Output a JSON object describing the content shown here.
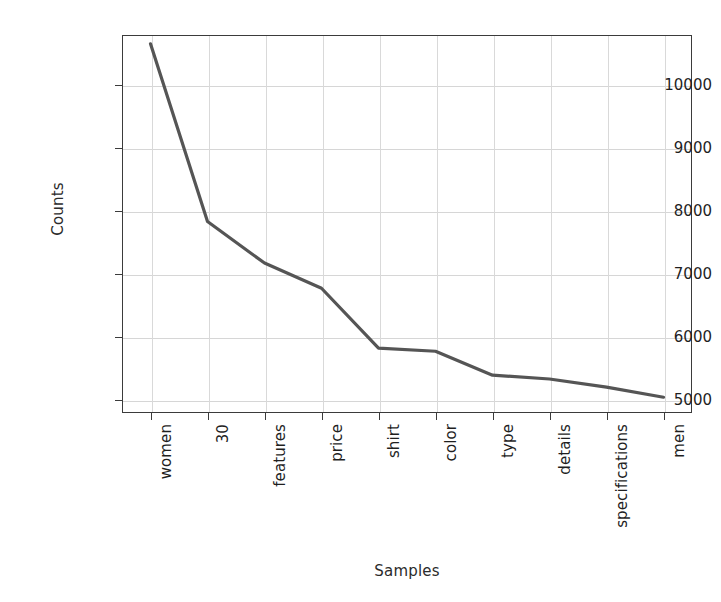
{
  "chart_data": {
    "type": "line",
    "title": "",
    "xlabel": "Samples",
    "ylabel": "Counts",
    "categories": [
      "women",
      "30",
      "features",
      "price",
      "shirt",
      "color",
      "type",
      "details",
      "specifications",
      "men"
    ],
    "values": [
      10660,
      7840,
      7180,
      6780,
      5830,
      5780,
      5400,
      5340,
      5210,
      5050
    ],
    "yticks": [
      5000,
      6000,
      7000,
      8000,
      9000,
      10000
    ],
    "ytick_labels": [
      "5000",
      "6000",
      "7000",
      "8000",
      "9000",
      "10000"
    ],
    "ylim": [
      4800,
      10800
    ],
    "grid": true,
    "legend": "none",
    "line_color": "#555555",
    "grid_color": "#d6d6d6",
    "axes_color": "#3b3b3b",
    "background": "#ffffff"
  }
}
